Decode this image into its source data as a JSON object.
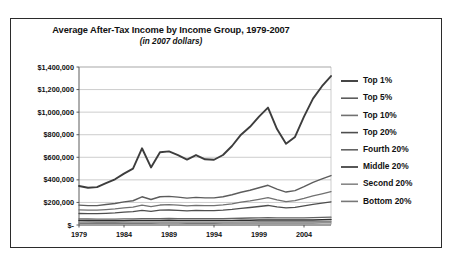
{
  "chart_data": {
    "type": "line",
    "title": "Average After-Tax Income by Income Group, 1979-2007",
    "subtitle": "(in 2007 dollars)",
    "xlabel": "",
    "ylabel": "",
    "grid": true,
    "legend_position": "right",
    "xlim": [
      1979,
      2007
    ],
    "ylim": [
      0,
      1400000
    ],
    "x": [
      1979,
      1980,
      1981,
      1982,
      1983,
      1984,
      1985,
      1986,
      1987,
      1988,
      1989,
      1990,
      1991,
      1992,
      1993,
      1994,
      1995,
      1996,
      1997,
      1998,
      1999,
      2000,
      2001,
      2002,
      2003,
      2004,
      2005,
      2006,
      2007
    ],
    "xticks": [
      1979,
      1984,
      1989,
      1994,
      1999,
      2004
    ],
    "xtick_labels": [
      "1979",
      "1984",
      "1989",
      "1994",
      "1999",
      "2004"
    ],
    "yticks": [
      0,
      200000,
      400000,
      600000,
      800000,
      1000000,
      1200000,
      1400000
    ],
    "ytick_labels": [
      "$-",
      "$200,000",
      "$400,000",
      "$600,000",
      "$800,000",
      "$1,000,000",
      "$1,200,000",
      "$1,400,000"
    ],
    "series": [
      {
        "name": "Top 1%",
        "color": "#3d3d3d",
        "width": 1.9,
        "values": [
          346000,
          330000,
          336000,
          372000,
          405000,
          455000,
          500000,
          680000,
          510000,
          645000,
          652000,
          620000,
          580000,
          620000,
          582000,
          578000,
          620000,
          700000,
          800000,
          870000,
          960000,
          1040000,
          850000,
          720000,
          780000,
          960000,
          1120000,
          1230000,
          1320000
        ]
      },
      {
        "name": "Top 5%",
        "color": "#5c5c5c",
        "width": 1.4,
        "values": [
          176000,
          172000,
          172000,
          182000,
          190000,
          205000,
          215000,
          250000,
          226000,
          250000,
          254000,
          247000,
          238000,
          245000,
          240000,
          240000,
          250000,
          268000,
          290000,
          308000,
          330000,
          352000,
          318000,
          292000,
          305000,
          340000,
          378000,
          408000,
          438000
        ]
      },
      {
        "name": "Top 10%",
        "color": "#717171",
        "width": 1.3,
        "values": [
          134000,
          131000,
          131000,
          137000,
          142000,
          152000,
          158000,
          176000,
          162000,
          177000,
          180000,
          176000,
          170000,
          174000,
          172000,
          172000,
          178000,
          188000,
          202000,
          214000,
          228000,
          242000,
          223000,
          208000,
          216000,
          236000,
          258000,
          276000,
          295000
        ]
      },
      {
        "name": "Top 20%",
        "color": "#4e4e4e",
        "width": 1.3,
        "values": [
          102000,
          100000,
          100000,
          103000,
          107000,
          114000,
          118000,
          129000,
          121000,
          131000,
          133000,
          130000,
          126000,
          129000,
          128000,
          128000,
          132000,
          138000,
          147000,
          155000,
          164000,
          173000,
          161000,
          152000,
          157000,
          169000,
          182000,
          193000,
          205000
        ]
      },
      {
        "name": "Fourth 20%",
        "color": "#636363",
        "width": 1.3,
        "values": [
          54000,
          53000,
          52000,
          52000,
          52000,
          54000,
          55000,
          56000,
          56000,
          57000,
          58000,
          57000,
          56000,
          56000,
          56000,
          56000,
          57000,
          58000,
          60000,
          62000,
          64000,
          65000,
          64000,
          63000,
          63000,
          64000,
          65000,
          67000,
          69000
        ]
      },
      {
        "name": "Middle 20%",
        "color": "#2e2e2e",
        "width": 1.5,
        "values": [
          39000,
          38000,
          37000,
          37000,
          37000,
          38000,
          39000,
          39000,
          40000,
          40000,
          41000,
          40000,
          39000,
          39000,
          39000,
          39000,
          40000,
          40000,
          42000,
          43000,
          44000,
          45000,
          44000,
          44000,
          44000,
          45000,
          45000,
          46000,
          48000
        ]
      },
      {
        "name": "Second 20%",
        "color": "#888888",
        "width": 1.3,
        "values": [
          25000,
          25000,
          24000,
          24000,
          24000,
          25000,
          25000,
          25000,
          26000,
          26000,
          26000,
          26000,
          25000,
          25000,
          25000,
          25000,
          26000,
          26000,
          27000,
          28000,
          29000,
          29000,
          29000,
          29000,
          29000,
          29000,
          29000,
          30000,
          31000
        ]
      },
      {
        "name": "Bottom 20%",
        "color": "#777777",
        "width": 1.2,
        "values": [
          15000,
          14500,
          14000,
          14000,
          14000,
          14500,
          14500,
          15000,
          15000,
          15500,
          15500,
          15500,
          15000,
          15000,
          15000,
          15000,
          15500,
          15500,
          16000,
          16500,
          17000,
          17500,
          17500,
          17500,
          17500,
          17500,
          17500,
          18000,
          18000
        ]
      }
    ]
  }
}
